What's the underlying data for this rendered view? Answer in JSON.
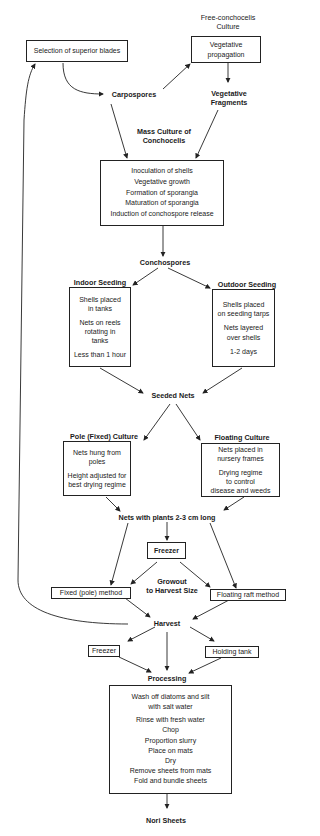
{
  "diagram": {
    "top": {
      "free_culture_label": [
        "Free-conchocelis",
        "Culture"
      ],
      "selection_box": "Selection of superior blades",
      "vegetative_box": [
        "Vegetative",
        "propagation"
      ],
      "carpospores": "Carpospores",
      "vegetative_fragments": [
        "Vegetative",
        "Fragments"
      ]
    },
    "mass_culture": {
      "label": [
        "Mass Culture of",
        "Conchocelis"
      ],
      "steps": [
        "Inoculation of shells",
        "Vegetative growth",
        "Formation of sporangia",
        "Maturation of sporangia",
        "Induction of conchospore release"
      ]
    },
    "conchospores": "Conchospores",
    "seeding": {
      "indoor": {
        "label": "Indoor Seeding",
        "lines": [
          [
            "Shells placed",
            "in tanks"
          ],
          [
            "Nets on reels",
            "rotating  in",
            "tanks"
          ],
          [
            "Less than 1 hour"
          ]
        ]
      },
      "outdoor": {
        "label": "Outdoor Seeding",
        "lines": [
          [
            "Shells placed",
            "on seeding tarps"
          ],
          [
            "Nets layered",
            "over shells"
          ],
          [
            "1-2 days"
          ]
        ]
      }
    },
    "seeded_nets": "Seeded Nets",
    "culture": {
      "pole": {
        "label": "Pole (Fixed) Culture",
        "lines": [
          [
            "Nets hung from",
            "poles"
          ],
          [
            "Height adjusted for",
            "best drying regime"
          ]
        ]
      },
      "floating": {
        "label": "Floating Culture",
        "lines": [
          [
            "Nets placed in",
            "nursery frames"
          ],
          [
            "Drying regime",
            "to control",
            "disease and weeds"
          ]
        ]
      }
    },
    "nets_with_plants": "Nets with plants 2-3 cm long",
    "freezer_1": "Freezer",
    "growout_label": [
      "Growout",
      "to Harvest Size"
    ],
    "fixed_method": "Fixed (pole) method",
    "floating_method": "Floating raft method",
    "harvest": "Harvest",
    "freezer_2": "Freezer",
    "holding_tank": "Holding tank",
    "processing": {
      "label": "Processing",
      "steps": [
        "Wash off diatoms and silt",
        "with salt water",
        "Rinse with fresh water",
        "Chop",
        "Proportion slurry",
        "Place on mats",
        "Dry",
        "Remove sheets from mats",
        "Fold and bundle sheets"
      ]
    },
    "output": "Nori Sheets"
  }
}
